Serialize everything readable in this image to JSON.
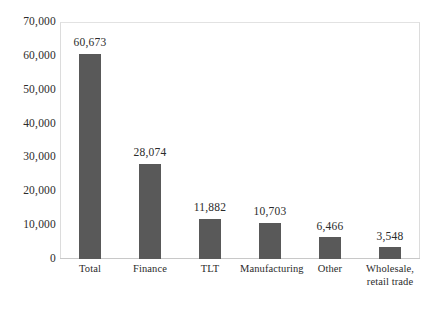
{
  "chart_data": {
    "type": "bar",
    "title": "",
    "subtitle": "",
    "xlabel": "",
    "ylabel": "",
    "categories": [
      "Total",
      "Finance",
      "TLT",
      "Manufacturing",
      "Other",
      "Wholesale,\nretail trade"
    ],
    "values": [
      60673,
      28074,
      11882,
      10703,
      6466,
      3548
    ],
    "value_labels": [
      "60,673",
      "28,074",
      "11,882",
      "10,703",
      "6,466",
      "3,548"
    ],
    "ylim": [
      0,
      70000
    ],
    "ytick_values": [
      0,
      10000,
      20000,
      30000,
      40000,
      50000,
      60000,
      70000
    ],
    "ytick_labels": [
      "0",
      "10,000",
      "20,000",
      "30,000",
      "40,000",
      "50,000",
      "60,000",
      "70,000"
    ],
    "grid": false,
    "legend": false,
    "bar_color": "#595959",
    "frame_color": "#dcdcdc",
    "background": "#ffffff",
    "text_color": "#2b2b2b"
  }
}
